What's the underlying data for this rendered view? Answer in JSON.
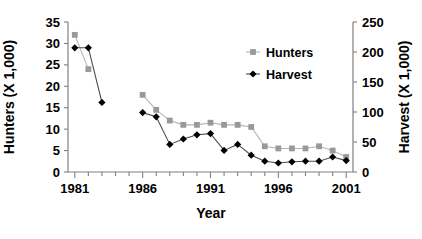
{
  "chart_data": {
    "type": "line",
    "title": "",
    "xlabel": "Year",
    "ylabel": "Hunters (X 1,000)",
    "y2label": "Harvest (X 1,000)",
    "xlim": [
      1980.5,
      2001.5
    ],
    "ylim": [
      0,
      35
    ],
    "y2lim": [
      0,
      250
    ],
    "grid": false,
    "legend_position": "top-center-right",
    "x_tick_labels": [
      "1981",
      "1986",
      "1991",
      "1996",
      "2001"
    ],
    "x_tick_values": [
      1981,
      1986,
      1991,
      1996,
      2001
    ],
    "y_tick_labels": [
      "0",
      "5",
      "10",
      "15",
      "20",
      "25",
      "30",
      "35"
    ],
    "y_tick_values": [
      0,
      5,
      10,
      15,
      20,
      25,
      30,
      35
    ],
    "y2_tick_labels": [
      "0",
      "50",
      "100",
      "150",
      "200",
      "250"
    ],
    "y2_tick_values": [
      0,
      50,
      100,
      150,
      200,
      250
    ],
    "series": [
      {
        "name": "Hunters",
        "marker": "square",
        "color": "#999999",
        "axis": "left",
        "x": [
          1981,
          1982,
          1986,
          1987,
          1988,
          1989,
          1990,
          1991,
          1992,
          1993,
          1994,
          1995,
          1996,
          1997,
          1998,
          1999,
          2000,
          2001
        ],
        "values": [
          32.0,
          24.0,
          18.0,
          14.5,
          12.0,
          11.0,
          11.0,
          11.5,
          11.0,
          11.0,
          10.5,
          6.0,
          5.5,
          5.5,
          5.5,
          6.0,
          5.0,
          3.5
        ]
      },
      {
        "name": "Harvest",
        "marker": "diamond",
        "color": "#000000",
        "axis": "right",
        "x": [
          1981,
          1982,
          1983,
          1986,
          1987,
          1988,
          1989,
          1990,
          1991,
          1992,
          1993,
          1994,
          1995,
          1996,
          1997,
          1998,
          1999,
          2000,
          2001
        ],
        "values": [
          207,
          207,
          116,
          99,
          92,
          46,
          55,
          62,
          64,
          36,
          46,
          28,
          18,
          15,
          17,
          18,
          18,
          25,
          19
        ]
      }
    ],
    "legend": [
      {
        "label": "Hunters",
        "marker": "square",
        "color": "#999999"
      },
      {
        "label": "Harvest",
        "marker": "diamond",
        "color": "#000000"
      }
    ]
  }
}
